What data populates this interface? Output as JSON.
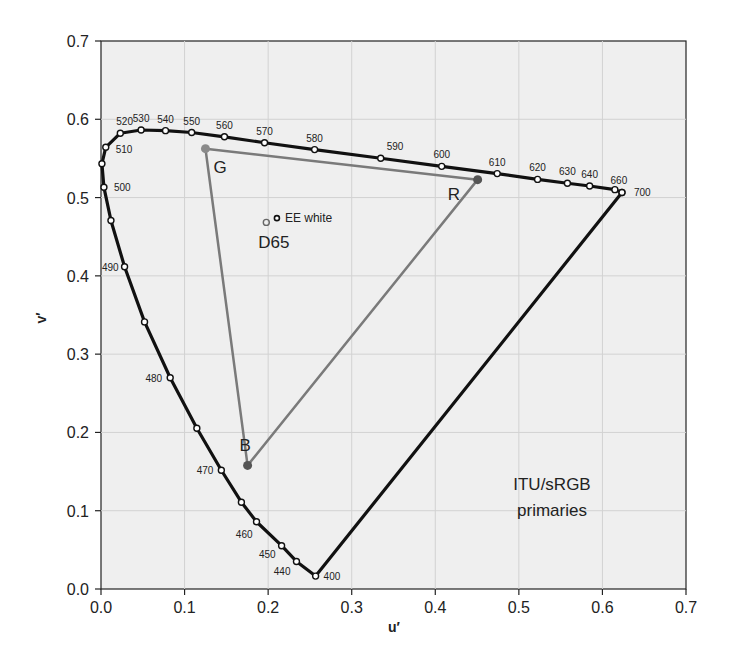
{
  "chart_data": {
    "type": "scatter",
    "title": "",
    "xlabel": "u′",
    "ylabel": "v′",
    "xlim": [
      0.0,
      0.7
    ],
    "ylim": [
      0.0,
      0.7
    ],
    "grid": true,
    "xticks": [
      "0.0",
      "0.1",
      "0.2",
      "0.3",
      "0.4",
      "0.5",
      "0.6",
      "0.7"
    ],
    "yticks": [
      "0.0",
      "0.1",
      "0.2",
      "0.3",
      "0.4",
      "0.5",
      "0.6",
      "0.7"
    ],
    "background": "#eeeeee",
    "series": [
      {
        "name": "Spectral locus",
        "color": "#111111",
        "points": [
          {
            "u": 0.2568,
            "v": 0.0165,
            "label": "400"
          },
          {
            "u": 0.2339,
            "v": 0.0352,
            "label": "440"
          },
          {
            "u": 0.2161,
            "v": 0.0553,
            "label": "450"
          },
          {
            "u": 0.1861,
            "v": 0.0859,
            "label": "460"
          },
          {
            "u": 0.168,
            "v": 0.1109,
            "label": ""
          },
          {
            "u": 0.144,
            "v": 0.1517,
            "label": "470"
          },
          {
            "u": 0.1147,
            "v": 0.2053,
            "label": ""
          },
          {
            "u": 0.0828,
            "v": 0.2698,
            "label": "480"
          },
          {
            "u": 0.0521,
            "v": 0.3412,
            "label": ""
          },
          {
            "u": 0.0282,
            "v": 0.4117,
            "label": "490"
          },
          {
            "u": 0.0119,
            "v": 0.4708,
            "label": ""
          },
          {
            "u": 0.0035,
            "v": 0.5131,
            "label": "500"
          },
          {
            "u": 0.0011,
            "v": 0.5432,
            "label": ""
          },
          {
            "u": 0.0057,
            "v": 0.5642,
            "label": "510"
          },
          {
            "u": 0.0231,
            "v": 0.5822,
            "label": "520"
          },
          {
            "u": 0.048,
            "v": 0.5863,
            "label": "530"
          },
          {
            "u": 0.0772,
            "v": 0.5855,
            "label": "540"
          },
          {
            "u": 0.1085,
            "v": 0.5831,
            "label": "550"
          },
          {
            "u": 0.1477,
            "v": 0.5776,
            "label": "560"
          },
          {
            "u": 0.1957,
            "v": 0.57,
            "label": "570"
          },
          {
            "u": 0.2556,
            "v": 0.5613,
            "label": "580"
          },
          {
            "u": 0.3347,
            "v": 0.5502,
            "label": "590"
          },
          {
            "u": 0.4077,
            "v": 0.5399,
            "label": "600"
          },
          {
            "u": 0.4741,
            "v": 0.5306,
            "label": "610"
          },
          {
            "u": 0.5224,
            "v": 0.5232,
            "label": "620"
          },
          {
            "u": 0.5581,
            "v": 0.5183,
            "label": "630"
          },
          {
            "u": 0.5847,
            "v": 0.5148,
            "label": "640"
          },
          {
            "u": 0.6149,
            "v": 0.5101,
            "label": ""
          },
          {
            "u": 0.6233,
            "v": 0.5065,
            "label": "660"
          },
          {
            "u": 0.6234,
            "v": 0.5065,
            "label": "700"
          }
        ],
        "closed_to": "400"
      },
      {
        "name": "ITU/sRGB primaries",
        "color": "#7a7a7a",
        "points": [
          {
            "u": 0.125,
            "v": 0.5625,
            "label": "G"
          },
          {
            "u": 0.4507,
            "v": 0.5229,
            "label": "R"
          },
          {
            "u": 0.1754,
            "v": 0.1579,
            "label": "B"
          }
        ]
      },
      {
        "name": "White points",
        "points": [
          {
            "u": 0.1978,
            "v": 0.4683,
            "label": "D65"
          },
          {
            "u": 0.2105,
            "v": 0.4737,
            "label": "EE white"
          }
        ]
      }
    ],
    "annotations": [
      {
        "text": "ITU/sRGB",
        "u": 0.495,
        "v": 0.135
      },
      {
        "text": "primaries",
        "u": 0.495,
        "v": 0.095
      }
    ]
  }
}
